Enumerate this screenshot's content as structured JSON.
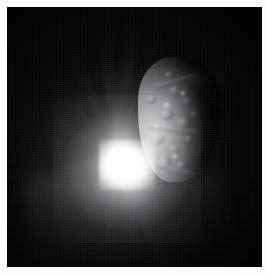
{
  "image": {
    "kind": "astronomical-photograph",
    "subject": "comet nucleus with impact flash and ejecta plume",
    "color_mode": "grayscale",
    "canvas": {
      "width": 266,
      "height": 275
    },
    "margin_color": "#fbfbfb",
    "frame": {
      "x": 7,
      "y": 7,
      "width": 255,
      "height": 260,
      "background_color": "#060607",
      "sky_color": "#0a0a0c"
    },
    "features": {
      "flash": {
        "label": "impact-flash",
        "center_x": 120,
        "center_y": 158,
        "core_color": "#ffffff",
        "halo_color": "#e8e8ec",
        "radius": 74
      },
      "nucleus": {
        "label": "comet-nucleus",
        "x": 138,
        "y": 57,
        "width": 82,
        "height": 125,
        "lit_color": "#d7d7da",
        "mid_color": "#8a8a8f",
        "shadow_color": "#1a1a1c"
      },
      "ejecta_rays": {
        "label": "ejecta-plume-rays",
        "origin_x": 111,
        "origin_y": 153,
        "color": "#ebebee",
        "rays": [
          {
            "angle": -96,
            "length": 150,
            "width": 13,
            "opacity": 0.55
          },
          {
            "angle": -84,
            "length": 158,
            "width": 15,
            "opacity": 0.62
          },
          {
            "angle": -72,
            "length": 142,
            "width": 12,
            "opacity": 0.5
          },
          {
            "angle": -61,
            "length": 132,
            "width": 11,
            "opacity": 0.46
          },
          {
            "angle": -50,
            "length": 120,
            "width": 10,
            "opacity": 0.4
          },
          {
            "angle": -112,
            "length": 128,
            "width": 11,
            "opacity": 0.42
          },
          {
            "angle": -128,
            "length": 104,
            "width": 10,
            "opacity": 0.32
          },
          {
            "angle": -146,
            "length": 86,
            "width": 12,
            "opacity": 0.24
          },
          {
            "angle": 168,
            "length": 92,
            "width": 13,
            "opacity": 0.26
          },
          {
            "angle": 54,
            "length": 118,
            "width": 14,
            "opacity": 0.38
          },
          {
            "angle": 66,
            "length": 128,
            "width": 13,
            "opacity": 0.42
          },
          {
            "angle": 78,
            "length": 112,
            "width": 11,
            "opacity": 0.34
          },
          {
            "angle": 96,
            "length": 100,
            "width": 12,
            "opacity": 0.28
          },
          {
            "angle": 120,
            "length": 84,
            "width": 12,
            "opacity": 0.22
          },
          {
            "angle": 38,
            "length": 96,
            "width": 11,
            "opacity": 0.3
          }
        ]
      },
      "surface_craters": [
        {
          "x": 30,
          "y": 28,
          "w": 15,
          "h": 12
        },
        {
          "x": 44,
          "y": 40,
          "w": 11,
          "h": 9
        },
        {
          "x": 22,
          "y": 52,
          "w": 13,
          "h": 11
        },
        {
          "x": 37,
          "y": 60,
          "w": 17,
          "h": 13
        },
        {
          "x": 12,
          "y": 76,
          "w": 14,
          "h": 12
        },
        {
          "x": 30,
          "y": 88,
          "w": 12,
          "h": 10
        },
        {
          "x": 46,
          "y": 78,
          "w": 10,
          "h": 9
        },
        {
          "x": 18,
          "y": 100,
          "w": 16,
          "h": 12
        },
        {
          "x": 38,
          "y": 104,
          "w": 11,
          "h": 9
        },
        {
          "x": 52,
          "y": 54,
          "w": 9,
          "h": 8
        },
        {
          "x": 8,
          "y": 38,
          "w": 10,
          "h": 9
        },
        {
          "x": 26,
          "y": 14,
          "w": 12,
          "h": 8
        }
      ],
      "bright_spots": [
        {
          "x": 24,
          "y": 44,
          "w": 9,
          "h": 8
        },
        {
          "x": 41,
          "y": 33,
          "w": 7,
          "h": 6
        },
        {
          "x": 14,
          "y": 66,
          "w": 8,
          "h": 7
        },
        {
          "x": 33,
          "y": 96,
          "w": 7,
          "h": 6
        }
      ],
      "ridges": [
        {
          "x": 16,
          "y": 22,
          "w": 44,
          "h": 6,
          "rot": -14
        },
        {
          "x": 10,
          "y": 70,
          "w": 50,
          "h": 5,
          "rot": 8
        },
        {
          "x": 20,
          "y": 112,
          "w": 40,
          "h": 5,
          "rot": 16
        }
      ]
    }
  }
}
